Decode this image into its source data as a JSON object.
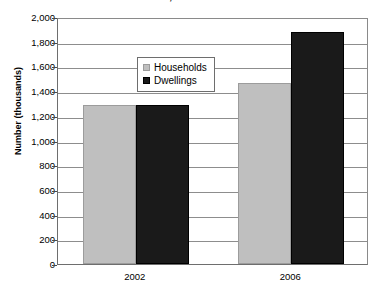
{
  "chart_data": {
    "type": "bar",
    "title": "Ireland, 2002 and 2006",
    "xlabel": "",
    "ylabel": "Number (thousands)",
    "categories": [
      "2002",
      "2006"
    ],
    "series": [
      {
        "name": "Households",
        "values": [
          1288,
          1462
        ],
        "color": "#bfbfbf"
      },
      {
        "name": "Dwellings",
        "values": [
          1288,
          1882
        ],
        "color": "#1a1a1a"
      }
    ],
    "ylim": [
      0,
      2000
    ],
    "ytick_step": 200,
    "ytick_labels": [
      "2,000",
      "1,800",
      "1,600",
      "1,400",
      "1,200",
      "1,000",
      "800",
      "600",
      "400",
      "200",
      "0"
    ],
    "grid": true,
    "legend_position": "upper-left-inside"
  }
}
